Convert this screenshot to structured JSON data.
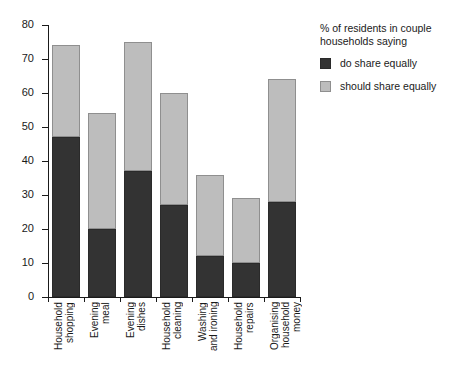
{
  "chart_data": {
    "type": "bar",
    "stacked": true,
    "title": "",
    "xlabel": "",
    "ylabel": "",
    "ylim": [
      0,
      80
    ],
    "ytick_step": 10,
    "yticks": [
      0,
      10,
      20,
      30,
      40,
      50,
      60,
      70,
      80
    ],
    "grid": false,
    "legend_position": "right",
    "legend_title": "% of residents in couple households saying",
    "categories": [
      "Household shopping",
      "Evening meal",
      "Evening dishes",
      "Household cleaning",
      "Washing and ironing",
      "Household repairs",
      "Organising household money"
    ],
    "category_lines": [
      [
        "Household",
        "shopping"
      ],
      [
        "Evening",
        "meal"
      ],
      [
        "Evening",
        "dishes"
      ],
      [
        "Household",
        "cleaning"
      ],
      [
        "Washing",
        "and ironing"
      ],
      [
        "Household",
        "repairs"
      ],
      [
        "Organising",
        "household",
        "money"
      ]
    ],
    "series": [
      {
        "name": "do share equally",
        "color": "#333333",
        "values": [
          47,
          20,
          37,
          27,
          12,
          10,
          28
        ]
      },
      {
        "name": "should share equally",
        "color": "#bdbdbd",
        "values": [
          74,
          54,
          75,
          60,
          36,
          29,
          64
        ],
        "note": "values are bar totals; light segment is total minus dark"
      }
    ],
    "totals": [
      74,
      54,
      75,
      60,
      36,
      29,
      64
    ]
  },
  "legend": {
    "title": "% of residents in couple households saying",
    "items": [
      {
        "label": "do share equally",
        "color": "#333333"
      },
      {
        "label": "should share equally",
        "color": "#bdbdbd"
      }
    ]
  }
}
